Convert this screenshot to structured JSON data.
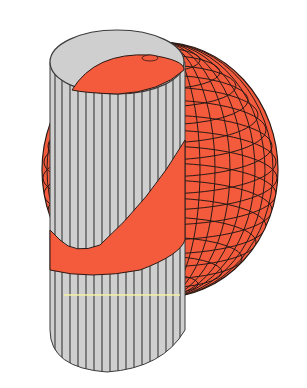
{
  "figure": {
    "colors": {
      "background": "#ffffff",
      "sphere_fill": "#f45a3c",
      "sphere_grid": "#2a1a16",
      "cylinder_fill": "#cfcfcf",
      "cylinder_lines": "#3a3a3a",
      "highlight_line": "#f3f0a0"
    },
    "objects": [
      {
        "name": "sphere",
        "grid": "latitude-longitude mesh"
      },
      {
        "name": "cylinder",
        "grid": "vertical rulings"
      }
    ]
  }
}
